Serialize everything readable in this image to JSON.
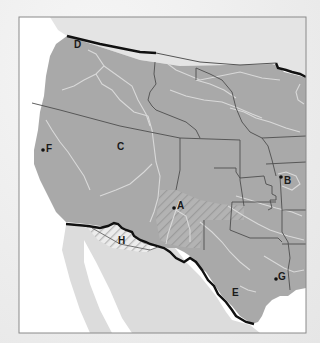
{
  "map": {
    "description": "Outline map of the western and south-central United States with lettered points",
    "colors": {
      "land_us": "#a9a9a9",
      "land_foreign": "#dcdcdc",
      "water": "#ffffff",
      "rivers": "#d8d8d8",
      "state_borders": "#555555",
      "national_border": "#111111",
      "frame": "#888888"
    },
    "labels": [
      {
        "id": "A",
        "text": "A",
        "x": 177,
        "y": 209,
        "has_dot": true
      },
      {
        "id": "B",
        "text": "B",
        "x": 285,
        "y": 180,
        "has_dot": true
      },
      {
        "id": "C",
        "text": "C",
        "x": 121,
        "y": 148,
        "has_dot": false
      },
      {
        "id": "D",
        "text": "D",
        "x": 78,
        "y": 47,
        "has_dot": false
      },
      {
        "id": "E",
        "text": "E",
        "x": 236,
        "y": 292,
        "has_dot": false
      },
      {
        "id": "F",
        "text": "F",
        "x": 47,
        "y": 148,
        "has_dot": true
      },
      {
        "id": "G",
        "text": "G",
        "x": 278,
        "y": 278,
        "has_dot": true
      },
      {
        "id": "H",
        "text": "H",
        "x": 122,
        "y": 240,
        "has_dot": false
      }
    ],
    "hatched_regions": [
      {
        "name": "mexican-cession-sw-region",
        "label": "A"
      },
      {
        "name": "gadsden-purchase-region",
        "label": "H"
      }
    ]
  }
}
